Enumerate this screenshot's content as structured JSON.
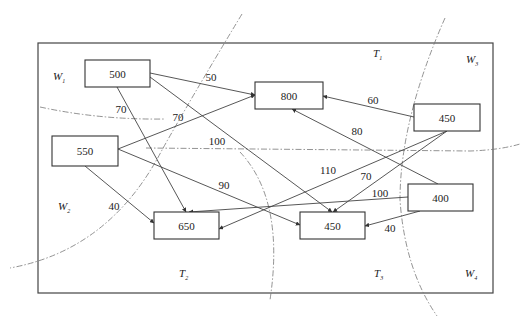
{
  "diagram": {
    "regions": [
      {
        "id": "W1",
        "letter": "W",
        "sub": "1",
        "x": 53,
        "y": 80
      },
      {
        "id": "W2",
        "letter": "W",
        "sub": "2",
        "x": 58,
        "y": 210
      },
      {
        "id": "W3",
        "letter": "W",
        "sub": "3",
        "x": 466,
        "y": 63
      },
      {
        "id": "W4",
        "letter": "W",
        "sub": "4",
        "x": 465,
        "y": 277
      },
      {
        "id": "T1",
        "letter": "T",
        "sub": "1",
        "x": 373,
        "y": 57
      },
      {
        "id": "T2",
        "letter": "T",
        "sub": "2",
        "x": 179,
        "y": 277
      },
      {
        "id": "T3",
        "letter": "T",
        "sub": "3",
        "x": 374,
        "y": 277
      }
    ],
    "nodes": [
      {
        "id": "n500",
        "label": "500",
        "x": 85,
        "y": 60,
        "w": 65,
        "h": 27
      },
      {
        "id": "n550",
        "label": "550",
        "x": 52,
        "y": 136,
        "w": 66,
        "h": 30
      },
      {
        "id": "n800",
        "label": "800",
        "x": 255,
        "y": 82,
        "w": 68,
        "h": 27
      },
      {
        "id": "n450a",
        "label": "450",
        "x": 414,
        "y": 104,
        "w": 66,
        "h": 27
      },
      {
        "id": "n400",
        "label": "400",
        "x": 408,
        "y": 184,
        "w": 65,
        "h": 27
      },
      {
        "id": "n650",
        "label": "650",
        "x": 154,
        "y": 212,
        "w": 65,
        "h": 27
      },
      {
        "id": "n450b",
        "label": "450",
        "x": 300,
        "y": 212,
        "w": 65,
        "h": 27
      }
    ],
    "edges": [
      {
        "from": "n500",
        "to": "n800",
        "label": "50",
        "x1": 150,
        "y1": 73,
        "x2": 255,
        "y2": 95,
        "lx": 211,
        "ly": 77
      },
      {
        "from": "n500",
        "to": "n650",
        "label": "70",
        "x1": 117,
        "y1": 87,
        "x2": 186,
        "y2": 212,
        "lx": 121,
        "ly": 109
      },
      {
        "from": "n500",
        "to": "n450b",
        "label": "100",
        "x1": 150,
        "y1": 77,
        "x2": 332,
        "y2": 212,
        "lx": 217,
        "ly": 141
      },
      {
        "from": "n550",
        "to": "n800",
        "label": "70",
        "x1": 118,
        "y1": 149,
        "x2": 255,
        "y2": 95,
        "lx": 178,
        "ly": 117
      },
      {
        "from": "n550",
        "to": "n650",
        "label": "40",
        "x1": 85,
        "y1": 166,
        "x2": 154,
        "y2": 223,
        "lx": 114,
        "ly": 206
      },
      {
        "from": "n550",
        "to": "n450b",
        "label": "90",
        "x1": 118,
        "y1": 149,
        "x2": 300,
        "y2": 225,
        "lx": 224,
        "ly": 185
      },
      {
        "from": "n450a",
        "to": "n800",
        "label": "60",
        "x1": 414,
        "y1": 117,
        "x2": 323,
        "y2": 96,
        "lx": 373,
        "ly": 100
      },
      {
        "from": "n450a",
        "to": "n650",
        "label": "110",
        "x1": 447,
        "y1": 131,
        "x2": 219,
        "y2": 229,
        "lx": 328,
        "ly": 170
      },
      {
        "from": "n450a",
        "to": "n450b",
        "label": "70",
        "x1": 447,
        "y1": 131,
        "x2": 333,
        "y2": 212,
        "lx": 366,
        "ly": 176
      },
      {
        "from": "n400",
        "to": "n800",
        "label": "80",
        "x1": 438,
        "y1": 184,
        "x2": 292,
        "y2": 109,
        "lx": 357,
        "ly": 131
      },
      {
        "from": "n400",
        "to": "n650",
        "label": "100",
        "x1": 408,
        "y1": 197,
        "x2": 189,
        "y2": 212,
        "lx": 380,
        "ly": 193
      },
      {
        "from": "n400",
        "to": "n450b",
        "label": "40",
        "x1": 420,
        "y1": 211,
        "x2": 365,
        "y2": 226,
        "lx": 390,
        "ly": 228
      }
    ],
    "boundaries": [
      {
        "id": "upper-left-curve",
        "d": "M 242 14 Q 190 100 162 150 Q 110 250 10 268"
      },
      {
        "id": "upper-horizontal",
        "d": "M 40 107 Q 100 120 165 119"
      },
      {
        "id": "middle-horizontal",
        "d": "M 146 148 L 470 151 Q 500 150 520 144"
      },
      {
        "id": "middle-vertical",
        "d": "M 240 152 Q 285 200 270 300"
      },
      {
        "id": "right-curve",
        "d": "M 445 18 Q 400 120 400 200 Q 405 270 437 316"
      }
    ],
    "frame": {
      "x": 38,
      "y": 43,
      "w": 455,
      "h": 250
    }
  }
}
